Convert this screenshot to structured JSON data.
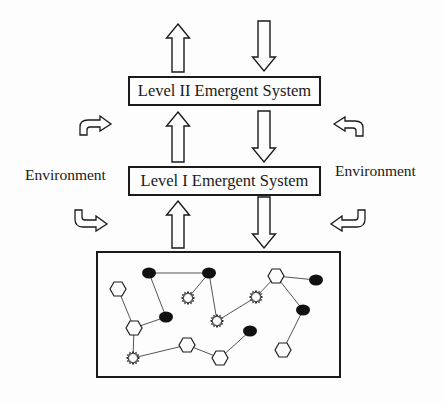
{
  "diagram": {
    "levels": [
      {
        "id": "level2",
        "label": "Level II Emergent System"
      },
      {
        "id": "level1",
        "label": "Level I Emergent System"
      }
    ],
    "environment": {
      "left_label": "Environment",
      "right_label": "Environment"
    },
    "vertical_arrows": [
      {
        "dir": "up",
        "x": 178,
        "y1": 24,
        "y2": 72
      },
      {
        "dir": "down",
        "x": 264,
        "y1": 21,
        "y2": 71
      },
      {
        "dir": "up",
        "x": 178,
        "y1": 112,
        "y2": 162
      },
      {
        "dir": "down",
        "x": 264,
        "y1": 111,
        "y2": 162
      },
      {
        "dir": "up",
        "x": 178,
        "y1": 201,
        "y2": 248
      },
      {
        "dir": "down",
        "x": 264,
        "y1": 197,
        "y2": 248
      }
    ],
    "curved_arrows": [
      {
        "position": "top-left",
        "direction": "up-then-right"
      },
      {
        "position": "bottom-left",
        "direction": "down-then-right"
      },
      {
        "position": "top-right",
        "direction": "up-then-left"
      },
      {
        "position": "bottom-right",
        "direction": "down-then-left"
      }
    ],
    "network_box": {
      "x": 97,
      "y": 252,
      "width": 243,
      "height": 125
    },
    "network": {
      "nodes": [
        {
          "id": "A",
          "type": "ellipse",
          "x": 149,
          "y": 273
        },
        {
          "id": "B",
          "type": "ellipse",
          "x": 209,
          "y": 273
        },
        {
          "id": "C",
          "type": "hexagon",
          "x": 118,
          "y": 289
        },
        {
          "id": "D",
          "type": "star",
          "x": 188,
          "y": 298
        },
        {
          "id": "E",
          "type": "ellipse",
          "x": 166,
          "y": 317
        },
        {
          "id": "F",
          "type": "hexagon",
          "x": 134,
          "y": 328
        },
        {
          "id": "G",
          "type": "hexagon",
          "x": 187,
          "y": 345
        },
        {
          "id": "H",
          "type": "star",
          "x": 133,
          "y": 358
        },
        {
          "id": "I",
          "type": "hexagon",
          "x": 276,
          "y": 276
        },
        {
          "id": "J",
          "type": "ellipse",
          "x": 316,
          "y": 280
        },
        {
          "id": "K",
          "type": "star",
          "x": 256,
          "y": 297
        },
        {
          "id": "L",
          "type": "ellipse",
          "x": 303,
          "y": 310
        },
        {
          "id": "M",
          "type": "star",
          "x": 217,
          "y": 321
        },
        {
          "id": "N",
          "type": "ellipse",
          "x": 250,
          "y": 331
        },
        {
          "id": "O",
          "type": "hexagon",
          "x": 283,
          "y": 350
        },
        {
          "id": "P",
          "type": "hexagon",
          "x": 220,
          "y": 358
        }
      ],
      "edges": [
        [
          "A",
          "B"
        ],
        [
          "A",
          "E"
        ],
        [
          "B",
          "D"
        ],
        [
          "B",
          "M"
        ],
        [
          "C",
          "F"
        ],
        [
          "E",
          "F"
        ],
        [
          "F",
          "H"
        ],
        [
          "H",
          "G"
        ],
        [
          "G",
          "P"
        ],
        [
          "P",
          "N"
        ],
        [
          "M",
          "K"
        ],
        [
          "K",
          "I"
        ],
        [
          "I",
          "J"
        ],
        [
          "I",
          "L"
        ],
        [
          "L",
          "O"
        ]
      ]
    },
    "colors": {
      "stroke": "#1a1a1a",
      "edge": "#555555",
      "fill": "#fdfdfd",
      "node_dark": "#111111"
    }
  }
}
